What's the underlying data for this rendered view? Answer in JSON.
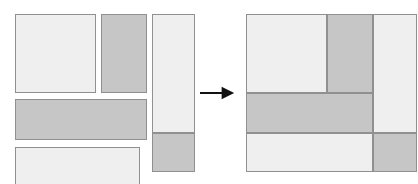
{
  "figure": {
    "width": 418,
    "height": 184,
    "background_color": "#ffffff"
  },
  "palette": {
    "fill_light": "#efefef",
    "fill_dark": "#c6c6c6",
    "border": "#909090",
    "arrow": "#111111"
  },
  "arrow": {
    "name": "transformation-arrow",
    "direction": "right",
    "x": 200,
    "y": 93,
    "length": 36
  },
  "chart_data": {
    "type": "diagram",
    "xlabel": "",
    "ylabel": "",
    "groups": [
      {
        "name": "input-rectangles",
        "label": "Input rectangles (unpacked)",
        "items": [
          {
            "id": "in-1",
            "shade": "light",
            "x": 15,
            "y": 14,
            "w": 81,
            "h": 79
          },
          {
            "id": "in-2",
            "shade": "dark",
            "x": 101,
            "y": 14,
            "w": 46,
            "h": 79
          },
          {
            "id": "in-3",
            "shade": "dark",
            "x": 15,
            "y": 99,
            "w": 132,
            "h": 41
          },
          {
            "id": "in-4",
            "shade": "light",
            "x": 15,
            "y": 147,
            "w": 125,
            "h": 40
          },
          {
            "id": "in-5",
            "shade": "light",
            "x": 152,
            "y": 14,
            "w": 43,
            "h": 119
          },
          {
            "id": "in-6",
            "shade": "dark",
            "x": 152,
            "y": 133,
            "w": 43,
            "h": 39
          }
        ]
      },
      {
        "name": "packed-rectangles",
        "label": "Packed result",
        "container": {
          "x": 246,
          "y": 14,
          "w": 171,
          "h": 158
        },
        "items": [
          {
            "id": "out-1",
            "shade": "light",
            "x": 246,
            "y": 14,
            "w": 81,
            "h": 79
          },
          {
            "id": "out-2",
            "shade": "dark",
            "x": 327,
            "y": 14,
            "w": 46,
            "h": 79
          },
          {
            "id": "out-3",
            "shade": "light",
            "x": 373,
            "y": 14,
            "w": 44,
            "h": 119
          },
          {
            "id": "out-4",
            "shade": "dark",
            "x": 246,
            "y": 93,
            "w": 127,
            "h": 40
          },
          {
            "id": "out-5",
            "shade": "light",
            "x": 246,
            "y": 133,
            "w": 127,
            "h": 39
          },
          {
            "id": "out-6",
            "shade": "dark",
            "x": 373,
            "y": 133,
            "w": 44,
            "h": 39
          }
        ]
      }
    ]
  }
}
